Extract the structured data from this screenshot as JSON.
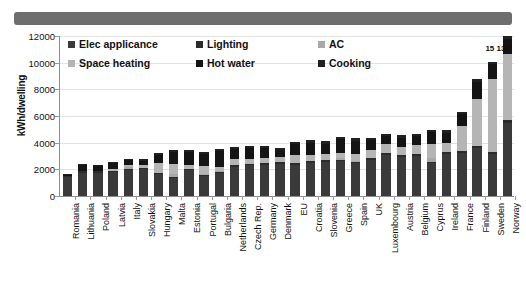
{
  "banner": {
    "label": ""
  },
  "chart_data": {
    "type": "bar",
    "stacked": true,
    "title": "",
    "xlabel": "",
    "ylabel": "kWh/dwelling",
    "ylim": [
      0,
      12000
    ],
    "ytick_values": [
      0,
      2000,
      4000,
      6000,
      8000,
      10000,
      12000
    ],
    "ytick_labels": [
      "0",
      "2000",
      "4000",
      "6000",
      "8000",
      "10000",
      "12000"
    ],
    "grid": true,
    "legend_position": "upper-left-inside",
    "categories": [
      "Romania",
      "Lithuania",
      "Poland",
      "Latvia",
      "Italy",
      "Slovakia",
      "Hungary",
      "Malta",
      "Estonia",
      "Portugal",
      "Bulgaria",
      "Netherlands",
      "Czech Rep.",
      "Germany",
      "Denmark",
      "EU",
      "Croatia",
      "Slovenia",
      "Greece",
      "Spain",
      "UK",
      "Luxembourg",
      "Austria",
      "Belgium",
      "Cyprus",
      "Ireland",
      "France",
      "Finland",
      "Sweden",
      "Norway"
    ],
    "series": [
      {
        "name": "Elec applicance",
        "color": "#3a3a3a",
        "values": [
          1400,
          1750,
          1750,
          1800,
          1950,
          2000,
          1650,
          1350,
          1950,
          1500,
          1700,
          2200,
          2300,
          2350,
          2400,
          2350,
          2500,
          2550,
          2600,
          2450,
          2700,
          3100,
          2950,
          3000,
          2450,
          3150,
          3200,
          3600,
          3150,
          5950
        ]
      },
      {
        "name": "Lighting",
        "color": "#2b2b2b",
        "values": [
          80,
          90,
          90,
          95,
          100,
          100,
          95,
          85,
          100,
          95,
          100,
          110,
          115,
          115,
          120,
          115,
          120,
          125,
          125,
          120,
          130,
          140,
          135,
          135,
          120,
          140,
          145,
          150,
          140,
          200
        ]
      },
      {
        "name": "AC",
        "color": "#a8a8a8",
        "values": [
          0,
          0,
          0,
          0,
          100,
          0,
          0,
          180,
          0,
          80,
          60,
          0,
          0,
          0,
          0,
          40,
          40,
          0,
          120,
          90,
          0,
          0,
          0,
          0,
          300,
          0,
          0,
          0,
          0,
          0
        ]
      },
      {
        "name": "Space heating",
        "color": "#b5b5b5",
        "values": [
          0,
          60,
          50,
          150,
          170,
          200,
          700,
          800,
          300,
          600,
          300,
          500,
          350,
          400,
          400,
          560,
          450,
          500,
          400,
          500,
          650,
          650,
          600,
          700,
          1000,
          700,
          1900,
          3500,
          5500,
          5400
        ]
      },
      {
        "name": "Hot water",
        "color": "#141414",
        "values": [
          120,
          400,
          350,
          400,
          350,
          350,
          600,
          900,
          950,
          900,
          1200,
          700,
          850,
          700,
          500,
          850,
          900,
          750,
          1000,
          1000,
          700,
          600,
          700,
          650,
          900,
          750,
          900,
          1300,
          1100,
          1200
        ]
      },
      {
        "name": "Cooking",
        "color": "#202020",
        "values": [
          50,
          100,
          100,
          120,
          120,
          130,
          150,
          150,
          150,
          140,
          150,
          150,
          160,
          160,
          160,
          160,
          170,
          170,
          170,
          170,
          170,
          180,
          180,
          180,
          180,
          180,
          190,
          200,
          190,
          230
        ]
      }
    ],
    "annotations": [
      {
        "text": "15 130",
        "category": "Norway",
        "note": "bar truncated at axis maximum"
      }
    ]
  },
  "legend": {
    "items": [
      {
        "label": "Elec applicance",
        "color": "#3a3a3a"
      },
      {
        "label": "Lighting",
        "color": "#2b2b2b"
      },
      {
        "label": "AC",
        "color": "#a8a8a8"
      },
      {
        "label": "Space heating",
        "color": "#b5b5b5"
      },
      {
        "label": "Hot water",
        "color": "#141414"
      },
      {
        "label": "Cooking",
        "color": "#202020"
      }
    ]
  }
}
